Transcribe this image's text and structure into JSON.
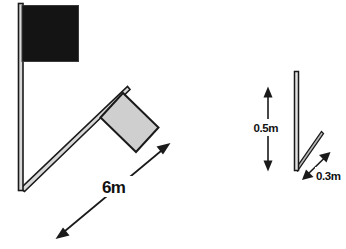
{
  "diagram": {
    "background_color": "#ffffff",
    "stroke_color": "#1a1a1a",
    "pole_fill_color": "#d8d8d8",
    "flag_dark_color": "#141414",
    "flag_light_color": "#cfcfcf",
    "left_assembly": {
      "vertical_pole": {
        "label": "vertical-flagpole"
      },
      "dark_flag": {
        "label": "dark-flag"
      },
      "diagonal_pole": {
        "label": "diagonal-flagpole"
      },
      "light_flag": {
        "label": "light-flag"
      },
      "dimension": {
        "value": "6m",
        "arrow_type": "double-headed"
      }
    },
    "right_assembly": {
      "vertical_post": {
        "label": "vertical-post"
      },
      "diagonal_member": {
        "label": "diagonal-member"
      },
      "height_dimension": {
        "value": "0.5m",
        "arrow_type": "double-headed",
        "orientation": "vertical"
      },
      "offset_dimension": {
        "value": "0.3m",
        "arrow_type": "double-headed",
        "orientation": "diagonal"
      }
    }
  }
}
